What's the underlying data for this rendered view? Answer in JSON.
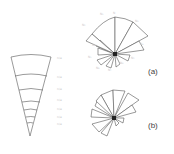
{
  "figure": {
    "panel_a_label": "(a)",
    "panel_b_label": "(b)",
    "wedge": {
      "ring_labels": [
        "n/a",
        "n/a",
        "n/a",
        "n/a",
        "n/a",
        "n/a",
        "n/a"
      ],
      "ring_count": 7
    },
    "rose_a": {
      "petal_labels": [
        "N",
        "N₁",
        "N₂",
        "N₃",
        "N₄",
        "N₅",
        "N₆",
        "N₇",
        "N₈",
        "N₉",
        "N₁₀"
      ]
    },
    "colors": {
      "stroke": "#555555",
      "label": "#c8c8c8",
      "center": "#222222"
    }
  }
}
